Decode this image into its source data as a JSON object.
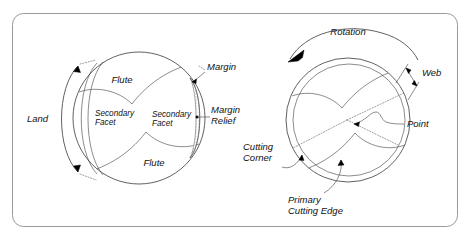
{
  "figure": {
    "frame": {
      "border_color": "#9a9a9a",
      "background": "#ffffff"
    },
    "ink_color": "#000000",
    "line_color": "#3a3a3a"
  },
  "left_view": {
    "name": "drill-point-side-view",
    "labels": {
      "land": "Land",
      "flute_top": "Flute",
      "flute_bottom": "Flute",
      "margin": "Margin",
      "margin_relief_line1": "Margin",
      "margin_relief_line2": "Relief",
      "secondary_facet_left_line1": "Secondary",
      "secondary_facet_left_line2": "Facet",
      "secondary_facet_right_line1": "Secondary",
      "secondary_facet_right_line2": "Facet",
      "primary_facet_upper": "Primary Facet",
      "primary_facet_lower": "Primary Facet"
    }
  },
  "right_view": {
    "name": "drill-point-end-view",
    "labels": {
      "rotation": "Rotation",
      "web": "Web",
      "point": "Point",
      "cutting_corner_line1": "Cutting",
      "cutting_corner_line2": "Corner",
      "primary_cutting_edge_line1": "Primary",
      "primary_cutting_edge_line2": "Cutting Edge"
    }
  }
}
